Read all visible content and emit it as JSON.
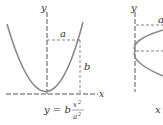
{
  "figure_left": {
    "axis_x_label": "x",
    "axis_y_label": "y",
    "label_a": "a",
    "label_b": "b",
    "equation": {
      "lhs": "y = b",
      "numerator": "x",
      "numerator_exp": "2",
      "denominator": "a",
      "denominator_exp": "2"
    }
  },
  "figure_right": {
    "axis_y_label": "y",
    "label_a": "a",
    "equation_start": "x"
  }
}
